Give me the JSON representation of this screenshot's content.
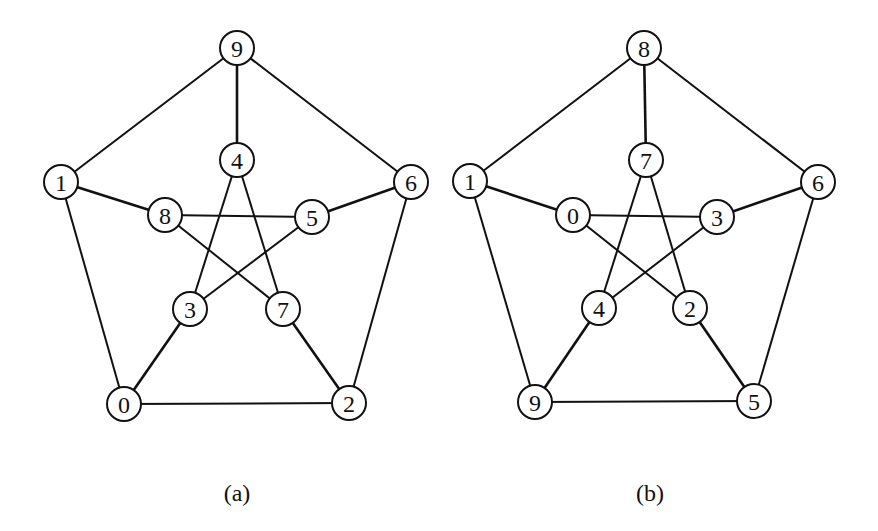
{
  "style": {
    "line_color": "#111111",
    "node_fill": "#ffffff",
    "node_radius": 17
  },
  "graphs": [
    {
      "caption": "(a)",
      "caption_pos": [
        237,
        493
      ],
      "nodes": [
        {
          "id": "0",
          "label": "0",
          "x": 124,
          "y": 404
        },
        {
          "id": "1",
          "label": "1",
          "x": 61,
          "y": 182
        },
        {
          "id": "2",
          "label": "2",
          "x": 349,
          "y": 403
        },
        {
          "id": "3",
          "label": "3",
          "x": 190,
          "y": 309
        },
        {
          "id": "4",
          "label": "4",
          "x": 237,
          "y": 160
        },
        {
          "id": "5",
          "label": "5",
          "x": 312,
          "y": 217
        },
        {
          "id": "6",
          "label": "6",
          "x": 411,
          "y": 182
        },
        {
          "id": "7",
          "label": "7",
          "x": 283,
          "y": 309
        },
        {
          "id": "8",
          "label": "8",
          "x": 165,
          "y": 215
        },
        {
          "id": "9",
          "label": "9",
          "x": 237,
          "y": 48
        }
      ],
      "edges": [
        {
          "from": "9",
          "to": "1",
          "type": "outer"
        },
        {
          "from": "9",
          "to": "6",
          "type": "outer"
        },
        {
          "from": "1",
          "to": "0",
          "type": "outer"
        },
        {
          "from": "6",
          "to": "2",
          "type": "outer"
        },
        {
          "from": "0",
          "to": "2",
          "type": "outer"
        },
        {
          "from": "9",
          "to": "4",
          "type": "spoke"
        },
        {
          "from": "1",
          "to": "8",
          "type": "spoke"
        },
        {
          "from": "6",
          "to": "5",
          "type": "spoke"
        },
        {
          "from": "0",
          "to": "3",
          "type": "spoke"
        },
        {
          "from": "2",
          "to": "7",
          "type": "spoke"
        },
        {
          "from": "4",
          "to": "3",
          "type": "inner"
        },
        {
          "from": "4",
          "to": "7",
          "type": "inner"
        },
        {
          "from": "8",
          "to": "5",
          "type": "inner"
        },
        {
          "from": "8",
          "to": "7",
          "type": "inner"
        },
        {
          "from": "5",
          "to": "3",
          "type": "inner"
        }
      ]
    },
    {
      "caption": "(b)",
      "caption_pos": [
        650,
        493
      ],
      "nodes": [
        {
          "id": "0",
          "label": "0",
          "x": 573,
          "y": 215
        },
        {
          "id": "1",
          "label": "1",
          "x": 470,
          "y": 181
        },
        {
          "id": "2",
          "label": "2",
          "x": 690,
          "y": 308
        },
        {
          "id": "3",
          "label": "3",
          "x": 717,
          "y": 217
        },
        {
          "id": "4",
          "label": "4",
          "x": 599,
          "y": 308
        },
        {
          "id": "5",
          "label": "5",
          "x": 754,
          "y": 401
        },
        {
          "id": "6",
          "label": "6",
          "x": 818,
          "y": 182
        },
        {
          "id": "7",
          "label": "7",
          "x": 646,
          "y": 160
        },
        {
          "id": "8",
          "label": "8",
          "x": 644,
          "y": 48
        },
        {
          "id": "9",
          "label": "9",
          "x": 535,
          "y": 402
        }
      ],
      "edges": [
        {
          "from": "8",
          "to": "1",
          "type": "outer"
        },
        {
          "from": "8",
          "to": "6",
          "type": "outer"
        },
        {
          "from": "1",
          "to": "9",
          "type": "outer"
        },
        {
          "from": "6",
          "to": "5",
          "type": "outer"
        },
        {
          "from": "9",
          "to": "5",
          "type": "outer"
        },
        {
          "from": "8",
          "to": "7",
          "type": "spoke"
        },
        {
          "from": "1",
          "to": "0",
          "type": "spoke"
        },
        {
          "from": "6",
          "to": "3",
          "type": "spoke"
        },
        {
          "from": "9",
          "to": "4",
          "type": "spoke"
        },
        {
          "from": "5",
          "to": "2",
          "type": "spoke"
        },
        {
          "from": "7",
          "to": "4",
          "type": "inner"
        },
        {
          "from": "7",
          "to": "2",
          "type": "inner"
        },
        {
          "from": "0",
          "to": "3",
          "type": "inner"
        },
        {
          "from": "0",
          "to": "2",
          "type": "inner"
        },
        {
          "from": "3",
          "to": "4",
          "type": "inner"
        }
      ]
    }
  ]
}
